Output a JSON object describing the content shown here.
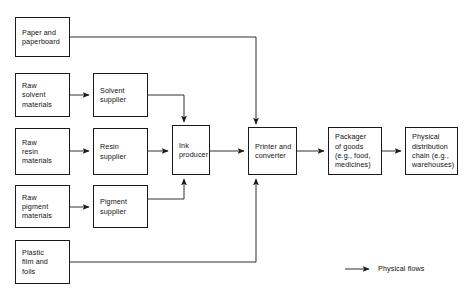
{
  "diagram": {
    "type": "flowchart",
    "line_color": "#1a1a1a",
    "background": "#ffffff",
    "nodes": [
      {
        "id": "paper",
        "label": "Paper and\npaperboard"
      },
      {
        "id": "raw_solvent",
        "label": "Raw\nsolvent\nmaterials"
      },
      {
        "id": "solvent_sup",
        "label": "Solvent\nsupplier"
      },
      {
        "id": "raw_resin",
        "label": "Raw\nresin\nmaterials"
      },
      {
        "id": "resin_sup",
        "label": "Resin\nsupplier"
      },
      {
        "id": "ink",
        "label": "Ink\nproducer"
      },
      {
        "id": "printer",
        "label": "Printer and\nconverter"
      },
      {
        "id": "packager",
        "label": "Packager\nof goods\n(e.g., food,\nmedicines)"
      },
      {
        "id": "distribution",
        "label": "Physical\ndistribution\nchain (e.g.,\nwarehouses)"
      },
      {
        "id": "raw_pigment",
        "label": "Raw\npigment\nmaterials"
      },
      {
        "id": "pigment_sup",
        "label": "Pigment\nsupplier"
      },
      {
        "id": "plastic",
        "label": "Plastic\nfilm and\nfoils"
      }
    ],
    "edges": [
      {
        "from": "paper",
        "to": "printer"
      },
      {
        "from": "raw_solvent",
        "to": "solvent_sup"
      },
      {
        "from": "solvent_sup",
        "to": "ink"
      },
      {
        "from": "raw_resin",
        "to": "resin_sup"
      },
      {
        "from": "resin_sup",
        "to": "ink"
      },
      {
        "from": "raw_pigment",
        "to": "pigment_sup"
      },
      {
        "from": "pigment_sup",
        "to": "ink"
      },
      {
        "from": "ink",
        "to": "printer"
      },
      {
        "from": "printer",
        "to": "packager"
      },
      {
        "from": "packager",
        "to": "distribution"
      },
      {
        "from": "plastic",
        "to": "printer"
      }
    ],
    "legend": {
      "label": "Physical flows",
      "symbol": "arrow"
    }
  }
}
